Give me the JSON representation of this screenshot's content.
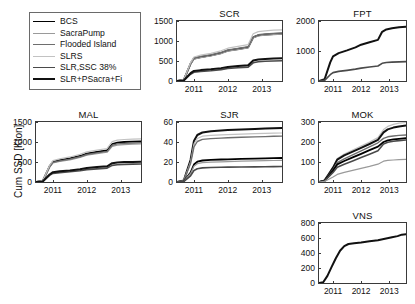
{
  "figure": {
    "ylabel": "Cum SSD [Kton]",
    "xlabel": ""
  },
  "legend": {
    "items": [
      {
        "label": "BCS",
        "color": "#000000",
        "width": 1.8
      },
      {
        "label": "SacraPump",
        "color": "#9a9a9a",
        "width": 1.2
      },
      {
        "label": "Flooded Island",
        "color": "#6e6e6e",
        "width": 1.4
      },
      {
        "label": "SLRS",
        "color": "#c2c2c2",
        "width": 1.2
      },
      {
        "label": "SLR,SSC 38%",
        "color": "#4a4a4a",
        "width": 1.6
      },
      {
        "label": "SLR+PSacra+Fi",
        "color": "#111111",
        "width": 2.0
      }
    ]
  },
  "chart_data": [
    {
      "type": "line",
      "title": "SCR",
      "xlabel": "",
      "ylabel": "Cum SSD [Kton]",
      "xlim": [
        2010.5,
        2013.6
      ],
      "ylim": [
        0,
        1500
      ],
      "yticks": [
        0,
        500,
        1000,
        1500
      ],
      "xticks": [
        2011,
        2012,
        2013
      ],
      "grid": false,
      "x": [
        2010.5,
        2010.7,
        2010.9,
        2011.0,
        2011.2,
        2011.5,
        2011.8,
        2012.0,
        2012.3,
        2012.6,
        2012.75,
        2012.9,
        2013.1,
        2013.35,
        2013.6
      ],
      "series": [
        {
          "name": "BCS",
          "values": [
            0,
            30,
            430,
            560,
            600,
            640,
            700,
            760,
            800,
            840,
            1090,
            1140,
            1160,
            1175,
            1185
          ]
        },
        {
          "name": "SacraPump",
          "values": [
            0,
            28,
            420,
            545,
            585,
            625,
            685,
            745,
            785,
            825,
            1075,
            1125,
            1145,
            1160,
            1170
          ]
        },
        {
          "name": "Flooded Island",
          "values": [
            0,
            32,
            445,
            575,
            615,
            655,
            715,
            775,
            815,
            855,
            1105,
            1155,
            1175,
            1190,
            1200
          ]
        },
        {
          "name": "SLRS",
          "values": [
            0,
            35,
            460,
            600,
            645,
            690,
            755,
            820,
            865,
            910,
            1180,
            1235,
            1255,
            1270,
            1280
          ]
        },
        {
          "name": "SLR,SSC 38%",
          "values": [
            0,
            12,
            170,
            220,
            240,
            258,
            285,
            312,
            330,
            348,
            455,
            480,
            492,
            500,
            506
          ]
        },
        {
          "name": "SLR+PSacra+Fi",
          "values": [
            0,
            14,
            195,
            252,
            272,
            292,
            322,
            352,
            372,
            392,
            512,
            540,
            552,
            562,
            568
          ]
        }
      ]
    },
    {
      "type": "line",
      "title": "FPT",
      "xlabel": "",
      "ylabel": "",
      "xlim": [
        2010.5,
        2013.6
      ],
      "ylim": [
        0,
        2000
      ],
      "yticks": [
        0,
        1000,
        2000
      ],
      "xticks": [
        2011,
        2012,
        2013
      ],
      "grid": false,
      "x": [
        2010.5,
        2010.7,
        2010.9,
        2011.0,
        2011.2,
        2011.5,
        2011.8,
        2012.0,
        2012.3,
        2012.6,
        2012.75,
        2012.9,
        2013.1,
        2013.35,
        2013.6
      ],
      "series": [
        {
          "name": "SLR+PSacra+Fi",
          "values": [
            0,
            60,
            620,
            820,
            930,
            1020,
            1120,
            1210,
            1290,
            1370,
            1640,
            1720,
            1760,
            1790,
            1810
          ]
        },
        {
          "name": "SLR,SSC 38%",
          "values": [
            0,
            20,
            210,
            280,
            320,
            355,
            395,
            430,
            465,
            500,
            590,
            615,
            628,
            638,
            645
          ]
        }
      ]
    },
    {
      "type": "line",
      "title": "MAL",
      "xlabel": "",
      "ylabel": "Cum SSD [Kton]",
      "xlim": [
        2010.5,
        2013.6
      ],
      "ylim": [
        0,
        1500
      ],
      "yticks": [
        0,
        500,
        1000,
        1500
      ],
      "xticks": [
        2011,
        2012,
        2013
      ],
      "grid": false,
      "x": [
        2010.5,
        2010.7,
        2010.9,
        2011.0,
        2011.2,
        2011.5,
        2011.8,
        2012.0,
        2012.3,
        2012.6,
        2012.75,
        2012.9,
        2013.1,
        2013.35,
        2013.6
      ],
      "series": [
        {
          "name": "BCS",
          "values": [
            0,
            30,
            390,
            505,
            545,
            590,
            650,
            710,
            750,
            790,
            950,
            985,
            1000,
            1010,
            1018
          ]
        },
        {
          "name": "SacraPump",
          "values": [
            0,
            27,
            365,
            475,
            512,
            555,
            612,
            668,
            706,
            744,
            890,
            922,
            936,
            946,
            953
          ]
        },
        {
          "name": "Flooded Island",
          "values": [
            0,
            29,
            378,
            490,
            528,
            572,
            630,
            688,
            727,
            766,
            918,
            952,
            966,
            976,
            984
          ]
        },
        {
          "name": "SLRS",
          "values": [
            0,
            33,
            412,
            535,
            578,
            626,
            690,
            752,
            795,
            838,
            1008,
            1045,
            1062,
            1072,
            1080
          ]
        },
        {
          "name": "SLR,SSC 38%",
          "values": [
            0,
            12,
            165,
            215,
            235,
            255,
            282,
            310,
            328,
            346,
            415,
            432,
            440,
            446,
            450
          ]
        },
        {
          "name": "SLR+PSacra+Fi",
          "values": [
            0,
            14,
            188,
            245,
            267,
            290,
            320,
            352,
            372,
            392,
            470,
            488,
            497,
            503,
            508
          ]
        }
      ]
    },
    {
      "type": "line",
      "title": "SJR",
      "xlabel": "",
      "ylabel": "",
      "xlim": [
        2010.5,
        2013.6
      ],
      "ylim": [
        0,
        60
      ],
      "yticks": [
        0,
        20,
        40,
        60
      ],
      "xticks": [
        2011,
        2012,
        2013
      ],
      "grid": false,
      "x": [
        2010.5,
        2010.7,
        2010.9,
        2011.0,
        2011.1,
        2011.25,
        2011.5,
        2011.8,
        2012.0,
        2012.4,
        2012.8,
        2013.1,
        2013.35,
        2013.6
      ],
      "series": [
        {
          "name": "SLR+PSacra+Fi",
          "values": [
            0,
            1.5,
            22,
            41,
            47,
            49.5,
            50.8,
            51.6,
            52.0,
            52.6,
            53.0,
            53.4,
            53.8,
            54.0
          ]
        },
        {
          "name": "SLRS",
          "values": [
            0,
            1.4,
            20,
            38,
            43.5,
            45.8,
            46.6,
            47.1,
            47.4,
            47.9,
            48.3,
            48.6,
            48.9,
            49.0
          ]
        },
        {
          "name": "Flooded Island",
          "values": [
            0,
            1.3,
            18.5,
            35,
            40.5,
            42.6,
            43.4,
            43.9,
            44.2,
            44.7,
            45.1,
            45.4,
            45.7,
            45.9
          ]
        },
        {
          "name": "BCS",
          "values": [
            0,
            0.7,
            9.5,
            17.5,
            20.3,
            21.5,
            22.1,
            22.5,
            22.7,
            23.1,
            23.4,
            23.6,
            23.8,
            24.0
          ]
        },
        {
          "name": "SacraPump",
          "values": [
            0,
            0.6,
            8.5,
            15.8,
            18.3,
            19.4,
            19.9,
            20.2,
            20.4,
            20.8,
            21.1,
            21.3,
            21.5,
            21.6
          ]
        },
        {
          "name": "SLR,SSC 38%",
          "values": [
            0,
            0.45,
            6.2,
            11.5,
            13.3,
            14.1,
            14.5,
            14.7,
            14.85,
            15.0,
            15.15,
            15.3,
            15.4,
            15.5
          ]
        }
      ]
    },
    {
      "type": "line",
      "title": "MOK",
      "xlabel": "",
      "ylabel": "",
      "xlim": [
        2010.5,
        2013.6
      ],
      "ylim": [
        0,
        300
      ],
      "yticks": [
        0,
        100,
        200,
        300
      ],
      "xticks": [
        2011,
        2012,
        2013
      ],
      "grid": false,
      "x": [
        2010.5,
        2010.7,
        2010.85,
        2011.0,
        2011.15,
        2011.4,
        2011.7,
        2012.0,
        2012.3,
        2012.6,
        2012.8,
        2012.95,
        2013.15,
        2013.35,
        2013.6
      ],
      "series": [
        {
          "name": "SLRS",
          "values": [
            0,
            8,
            42,
            75,
            118,
            140,
            160,
            180,
            200,
            222,
            262,
            278,
            288,
            294,
            298
          ]
        },
        {
          "name": "SLR+PSacra+Fi",
          "values": [
            0,
            8,
            40,
            72,
            112,
            133,
            152,
            171,
            190,
            211,
            248,
            263,
            272,
            278,
            282
          ]
        },
        {
          "name": "Flooded Island",
          "values": [
            0,
            7,
            35,
            62,
            97,
            116,
            136,
            156,
            176,
            196,
            218,
            226,
            230,
            233,
            235
          ]
        },
        {
          "name": "BCS",
          "values": [
            0,
            6,
            32,
            57,
            88,
            105,
            123,
            141,
            159,
            177,
            200,
            208,
            213,
            216,
            219
          ]
        },
        {
          "name": "SLR,SSC 38%",
          "values": [
            0,
            5,
            27,
            48,
            74,
            89,
            105,
            122,
            139,
            156,
            190,
            199,
            204,
            207,
            210
          ]
        },
        {
          "name": "SacraPump",
          "values": [
            0,
            3,
            14,
            25,
            38,
            48,
            58,
            68,
            78,
            89,
            104,
            108,
            110,
            112,
            113
          ]
        }
      ]
    },
    {
      "type": "line",
      "title": "VNS",
      "xlabel": "",
      "ylabel": "",
      "xlim": [
        2010.5,
        2013.6
      ],
      "ylim": [
        0,
        800
      ],
      "yticks": [
        0,
        200,
        400,
        600,
        800
      ],
      "xticks": [
        2011,
        2012,
        2013
      ],
      "grid": false,
      "x": [
        2010.5,
        2010.65,
        2010.8,
        2010.95,
        2011.1,
        2011.25,
        2011.4,
        2011.55,
        2011.75,
        2012.0,
        2012.3,
        2012.6,
        2012.85,
        2013.1,
        2013.3,
        2013.45,
        2013.6
      ],
      "series": [
        {
          "name": "SLR+PSacra+Fi",
          "values": [
            0,
            10,
            95,
            215,
            330,
            430,
            492,
            520,
            530,
            540,
            556,
            570,
            590,
            610,
            625,
            645,
            650
          ]
        }
      ]
    }
  ]
}
